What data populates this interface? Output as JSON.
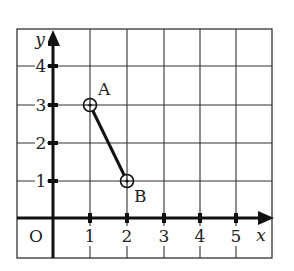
{
  "diagram": {
    "type": "coordinate-grid",
    "axes": {
      "x_label": "x",
      "y_label": "y",
      "origin_label": "O",
      "x_ticks": [
        "1",
        "2",
        "3",
        "4",
        "5"
      ],
      "y_ticks": [
        "1",
        "2",
        "3",
        "4"
      ]
    },
    "points": [
      {
        "label": "A",
        "x": 1,
        "y": 3
      },
      {
        "label": "B",
        "x": 2,
        "y": 1
      }
    ],
    "segments": [
      {
        "from": "A",
        "to": "B"
      }
    ],
    "colors": {
      "ink": "#222222",
      "grid": "#333333",
      "background": "#ffffff"
    }
  }
}
